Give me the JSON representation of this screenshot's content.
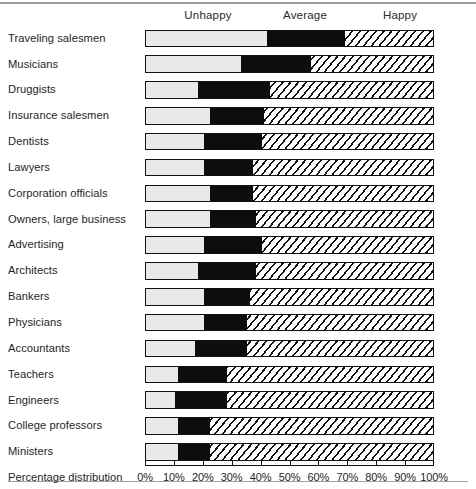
{
  "chart_data": {
    "type": "bar",
    "subtype": "stacked-horizontal-100-percent",
    "title": "",
    "xlabel": "Percentage distribution",
    "ylabel": "",
    "xlim": [
      0,
      100
    ],
    "grid": false,
    "legend_position": "top",
    "segment_headers": [
      "Unhappy",
      "Average",
      "Happy"
    ],
    "series": [
      {
        "name": "Unhappy",
        "fill": "light-gray",
        "values": [
          42,
          33,
          18,
          22,
          20,
          20,
          22,
          22,
          20,
          18,
          20,
          20,
          17,
          11,
          10,
          11,
          11
        ]
      },
      {
        "name": "Average",
        "fill": "solid-black",
        "values": [
          27,
          24,
          25,
          19,
          20,
          17,
          15,
          16,
          20,
          20,
          16,
          15,
          18,
          17,
          18,
          11,
          11
        ]
      },
      {
        "name": "Happy",
        "fill": "diagonal-hatch",
        "values": [
          31,
          43,
          57,
          59,
          60,
          63,
          63,
          62,
          60,
          62,
          64,
          65,
          65,
          72,
          72,
          78,
          78
        ]
      }
    ],
    "categories": [
      "Traveling salesmen",
      "Musicians",
      "Druggists",
      "Insurance salesmen",
      "Dentists",
      "Lawyers",
      "Corporation officials",
      "Owners, large business",
      "Advertising",
      "Architects",
      "Bankers",
      "Physicians",
      "Accountants",
      "Teachers",
      "Engineers",
      "College professors",
      "Ministers"
    ],
    "xticks": [
      0,
      10,
      20,
      30,
      40,
      50,
      60,
      70,
      80,
      90,
      100
    ],
    "xticklabels": [
      "0%",
      "10%",
      "20%",
      "30%",
      "40%",
      "50%",
      "60%",
      "70%",
      "80%",
      "90%",
      "100%"
    ],
    "colors": {
      "unhappy": "#e9e9e7",
      "average": "#0d0d0d",
      "happy_stroke": "#111111",
      "happy_background": "#ffffff",
      "outline": "#111111",
      "text": "#1f1f1f"
    }
  }
}
